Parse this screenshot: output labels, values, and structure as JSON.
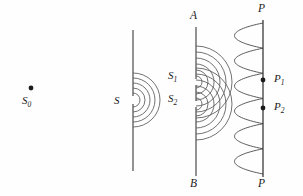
{
  "figure": {
    "type": "optics-diagram",
    "width": 303,
    "height": 196,
    "background_color": "#fefefe",
    "ink_color": "#2b2b2b",
    "wave_color": "#555555"
  },
  "labels": {
    "source": "S",
    "source_sub": "0",
    "single_slit": "S",
    "slit1": "S",
    "slit1_sub": "1",
    "slit2": "S",
    "slit2_sub": "2",
    "screen_top": "P",
    "screen_bottom": "P",
    "point1": "P",
    "point1_sub": "1",
    "point2": "P",
    "point2_sub": "2",
    "barrier_top": "A",
    "barrier_bottom": "B"
  },
  "geometry": {
    "source_point": {
      "x": 31,
      "y": 88
    },
    "first_barrier": {
      "x": 133,
      "y_top": 30,
      "y_bottom": 171
    },
    "single_slit_point": {
      "x": 133,
      "y": 100
    },
    "second_barrier": {
      "x": 196,
      "y_top": 27,
      "y_bottom": 176
    },
    "slit1_point": {
      "x": 196,
      "y": 82
    },
    "slit2_point": {
      "x": 196,
      "y": 104
    },
    "screen": {
      "x": 263,
      "y_top": 20,
      "y_bottom": 177
    },
    "marked_point1": {
      "x": 263,
      "y": 80
    },
    "marked_point2": {
      "x": 263,
      "y": 108
    },
    "single_slit_arc_radii": [
      7,
      12,
      17,
      22,
      27
    ],
    "double_slit_arc_radii": [
      6,
      12,
      18,
      24,
      30,
      36
    ],
    "intensity_fringe_count": 6,
    "intensity_lobe_depth": 40
  }
}
